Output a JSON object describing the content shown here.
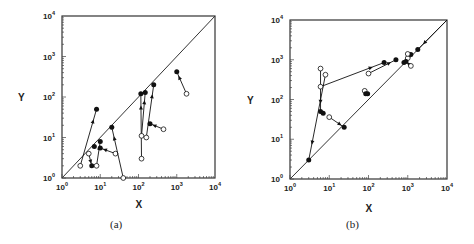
{
  "figure": {
    "panels": [
      {
        "id": "a",
        "caption": "(a)",
        "xlabel": "X",
        "ylabel": "Y"
      },
      {
        "id": "b",
        "caption": "(b)",
        "xlabel": "X",
        "ylabel": "Y"
      }
    ],
    "tick_base": "10",
    "tick_exponents": [
      "0",
      "1",
      "2",
      "3",
      "4"
    ]
  },
  "chart_data": [
    {
      "type": "scatter",
      "title": "(a)",
      "xlabel": "X",
      "ylabel": "Y",
      "xscale": "log",
      "yscale": "log",
      "xlim": [
        1,
        10000
      ],
      "ylim": [
        1,
        10000
      ],
      "x_ticks": [
        "10^0",
        "10^1",
        "10^2",
        "10^3",
        "10^4"
      ],
      "y_ticks": [
        "10^0",
        "10^1",
        "10^2",
        "10^3",
        "10^4"
      ],
      "grid": false,
      "reference_line": "y = x diagonal",
      "legend": "open circle = start, filled circle = end, arrow = direction",
      "arrows": [
        {
          "from": [
            3,
            2
          ],
          "to": [
            8,
            50
          ]
        },
        {
          "from": [
            5,
            4
          ],
          "to": [
            6,
            2
          ]
        },
        {
          "from": [
            8,
            2
          ],
          "to": [
            10,
            8
          ]
        },
        {
          "from": [
            25,
            4
          ],
          "to": [
            10,
            5.5
          ]
        },
        {
          "from": [
            40,
            1
          ],
          "to": [
            20,
            18
          ]
        },
        {
          "from": [
            120,
            3
          ],
          "to": [
            115,
            120
          ]
        },
        {
          "from": [
            120,
            11
          ],
          "to": [
            150,
            130
          ]
        },
        {
          "from": [
            160,
            10
          ],
          "to": [
            250,
            200
          ]
        },
        {
          "from": [
            450,
            16
          ],
          "to": [
            200,
            22
          ]
        },
        {
          "from": [
            1800,
            120
          ],
          "to": [
            1000,
            420
          ]
        }
      ],
      "extra_filled": [
        [
          7,
          6
        ]
      ]
    },
    {
      "type": "scatter",
      "title": "(b)",
      "xlabel": "X",
      "ylabel": "Y",
      "xscale": "log",
      "yscale": "log",
      "xlim": [
        1,
        10000
      ],
      "ylim": [
        1,
        10000
      ],
      "x_ticks": [
        "10^0",
        "10^1",
        "10^2",
        "10^3",
        "10^4"
      ],
      "y_ticks": [
        "10^0",
        "10^1",
        "10^2",
        "10^3",
        "10^4"
      ],
      "grid": false,
      "reference_line": "y = x diagonal",
      "legend": "open circle = start, filled circle = end, arrow = direction",
      "arrows": [
        {
          "from": [
            6,
            600
          ],
          "to": [
            6,
            50
          ]
        },
        {
          "from": [
            8,
            420
          ],
          "to": [
            3,
            3
          ]
        },
        {
          "from": [
            6,
            210
          ],
          "to": [
            250,
            850
          ]
        },
        {
          "from": [
            100,
            450
          ],
          "to": [
            500,
            1000
          ]
        },
        {
          "from": [
            10,
            36
          ],
          "to": [
            24,
            20
          ]
        },
        {
          "from": [
            80,
            165
          ],
          "to": [
            95,
            140
          ]
        },
        {
          "from": [
            1000,
            1100
          ],
          "to": [
            800,
            850
          ]
        },
        {
          "from": [
            10000,
            10000
          ],
          "to": [
            1800,
            1800
          ]
        },
        {
          "from": [
            1200,
            700
          ],
          "to": [
            900,
            900
          ]
        }
      ],
      "extra_filled": [
        [
          7,
          45
        ],
        [
          1200,
          1350
        ],
        [
          85,
          140
        ]
      ],
      "extra_open": [
        [
          1000,
          1400
        ]
      ]
    }
  ]
}
